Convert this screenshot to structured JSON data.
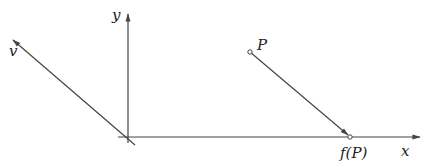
{
  "diagram": {
    "type": "coordinate-projection",
    "colors": {
      "stroke": "#444444",
      "text": "#222222",
      "background": "#ffffff"
    },
    "labels": {
      "x_axis": "x",
      "y_axis": "y",
      "vector": "v",
      "point": "P",
      "image_point": "f(P)"
    },
    "elements": [
      {
        "id": "x-axis",
        "kind": "arrow",
        "from": [
          118,
          137
        ],
        "to": [
          420,
          137
        ]
      },
      {
        "id": "y-axis",
        "kind": "arrow",
        "from": [
          128,
          143
        ],
        "to": [
          128,
          14
        ]
      },
      {
        "id": "vector-v",
        "kind": "arrow",
        "from": [
          135,
          145
        ],
        "to": [
          13,
          40
        ]
      },
      {
        "id": "projection",
        "kind": "arrow",
        "from": [
          250,
          52
        ],
        "to": [
          350,
          137
        ]
      },
      {
        "id": "point-P",
        "kind": "point",
        "at": [
          250,
          52
        ]
      },
      {
        "id": "point-fP",
        "kind": "point",
        "at": [
          350,
          137
        ]
      }
    ]
  }
}
